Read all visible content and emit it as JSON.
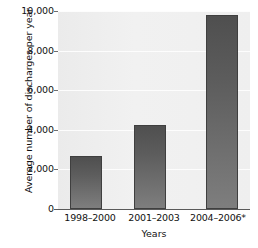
{
  "chart_data": {
    "type": "bar",
    "title": "",
    "xlabel": "Years",
    "ylabel": "Average number of discharges per year",
    "categories": [
      "1998–2000",
      "2001–2003",
      "2004–2006*"
    ],
    "values": [
      2700,
      4250,
      9800
    ],
    "ylim": [
      0,
      10000
    ],
    "yticks": [
      0,
      2000,
      4000,
      6000,
      8000,
      10000
    ],
    "ytick_labels": [
      "0",
      "2,000",
      "4,000",
      "6,000",
      "8,000",
      "10,000"
    ],
    "grid": true,
    "legend": null,
    "series": [
      {
        "name": "Average number of discharges per year",
        "values": [
          2700,
          4250,
          9800
        ]
      }
    ],
    "colors": {
      "bar_top": "#4f4f4f",
      "bar_bottom": "#7e7e7e",
      "bar_outline": "#3f3f3f",
      "plot_background": "#efefef",
      "gridline": "#fdfdfd",
      "axis_line": "#5a5a5a",
      "text": "#111111"
    }
  }
}
